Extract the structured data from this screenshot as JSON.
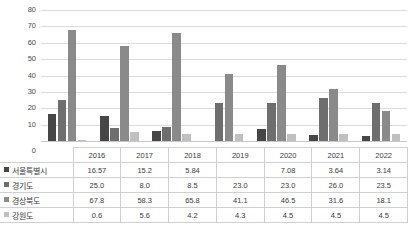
{
  "top_fragment": "",
  "chart_data": {
    "type": "bar",
    "title": "",
    "xlabel": "",
    "ylabel": "",
    "ylim": [
      0,
      80
    ],
    "ytick_step": 10,
    "yticks": [
      "80",
      "70",
      "60",
      "50",
      "40",
      "30",
      "20",
      "10",
      "0"
    ],
    "grid": true,
    "legend_position": "data-table-left",
    "categories": [
      "2016",
      "2017",
      "2018",
      "2019",
      "2020",
      "2021",
      "2022"
    ],
    "series": [
      {
        "name": "서울특별시",
        "color": "#464646",
        "values": [
          16.57,
          15.2,
          5.84,
          null,
          7.08,
          3.64,
          3.14
        ],
        "labels": [
          "16.57",
          "15.2",
          "5.84",
          "",
          "7.08",
          "3.64",
          "3.14"
        ]
      },
      {
        "name": "경기도",
        "color": "#6e6e6e",
        "values": [
          25.0,
          8.0,
          8.5,
          23.0,
          23.0,
          26.0,
          23.5
        ],
        "labels": [
          "25.0",
          "8.0",
          "8.5",
          "23.0",
          "23.0",
          "26.0",
          "23.5"
        ]
      },
      {
        "name": "경상북도",
        "color": "#8a8a8a",
        "values": [
          67.8,
          58.3,
          65.8,
          41.1,
          46.5,
          31.6,
          18.1
        ],
        "labels": [
          "67.8",
          "58.3",
          "65.8",
          "41.1",
          "46.5",
          "31.6",
          "18.1"
        ]
      },
      {
        "name": "강원도",
        "color": "#c0c0c0",
        "values": [
          0.6,
          5.6,
          4.2,
          4.3,
          4.5,
          4.5,
          4.5
        ],
        "labels": [
          "0.6",
          "5.6",
          "4.2",
          "4.3",
          "4.5",
          "4.5",
          "4.5"
        ]
      }
    ]
  }
}
